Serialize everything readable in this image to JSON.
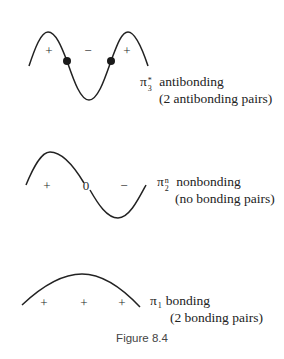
{
  "figure": {
    "caption": "Figure 8.4",
    "stroke_color": "#222222"
  },
  "orbitals": [
    {
      "id": "pi3",
      "symbol": "π",
      "superscript": "*",
      "subscript": "3",
      "type_label": "antibonding",
      "note": "(2 antibonding pairs)",
      "phase_signs": [
        "+",
        "−",
        "+"
      ],
      "node_dots": 2
    },
    {
      "id": "pi2",
      "symbol": "π",
      "superscript": "n",
      "subscript": "2",
      "type_label": "nonbonding",
      "note": "(no bonding pairs)",
      "phase_signs": [
        "+",
        "0",
        "−"
      ],
      "node_dots": 0
    },
    {
      "id": "pi1",
      "symbol": "π",
      "superscript": "",
      "subscript": "1",
      "type_label": "bonding",
      "note": "(2 bonding pairs)",
      "phase_signs": [
        "+",
        "+",
        "+"
      ],
      "node_dots": 0
    }
  ]
}
